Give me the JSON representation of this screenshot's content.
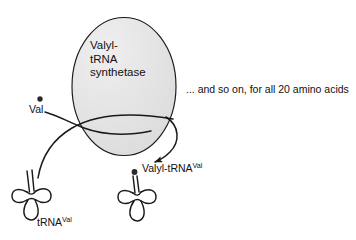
{
  "figure": {
    "background_color": "#ffffff",
    "ink_color": "#111111",
    "enzyme": {
      "shape": "ellipse",
      "fill_color": "#e2e2e2",
      "stroke_color": "#1a1a1a",
      "label_lines": [
        "Valyl-",
        "tRNA",
        "synthetase"
      ]
    },
    "caption": {
      "text": "... and so on, for all 20 amino acids"
    },
    "substrate": {
      "label": "Val",
      "marker": "amino-acid-dot"
    },
    "product": {
      "label_main": "Valyl-tRNA",
      "label_superscript": "Val",
      "marker": "amino-acid-dot"
    },
    "trna": {
      "label_main": "tRNA",
      "label_superscript": "Val",
      "shape": "cloverleaf"
    },
    "arrows": [
      {
        "name": "val-into-enzyme",
        "from": "Val amino acid",
        "to": "Valyl-tRNA synthetase"
      },
      {
        "name": "trna-into-enzyme",
        "from": "tRNA(Val)",
        "to": "Valyl-tRNA synthetase"
      },
      {
        "name": "enzyme-to-product",
        "from": "Valyl-tRNA synthetase",
        "to": "Valyl-tRNA(Val)",
        "arrowhead": true
      }
    ]
  }
}
